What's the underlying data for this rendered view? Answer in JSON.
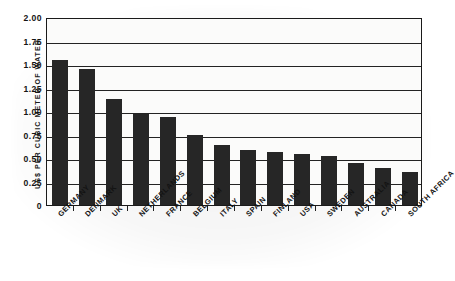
{
  "chart_data": {
    "type": "bar",
    "title": "",
    "subtitle": "",
    "xlabel": "",
    "ylabel": "US$ PER CUBIC METER OF WATER",
    "ylim": [
      0,
      2.0
    ],
    "ytick_labels": [
      "2.00",
      "1.75",
      "1.50",
      "1.25",
      "1.00",
      "0.75",
      "0.50",
      "0.25",
      "0"
    ],
    "ytick_values": [
      2.0,
      1.75,
      1.5,
      1.25,
      1.0,
      0.75,
      0.5,
      0.25,
      0
    ],
    "grid": "horizontal",
    "legend": "none",
    "bar_color": "#262626",
    "categories": [
      "GERMANY",
      "DENMARK",
      "UK",
      "NETHERLANDS",
      "FRANCE",
      "BELGIUM",
      "ITALY",
      "SPAIN",
      "FINLAND",
      "USA",
      "SWEDEN",
      "AUSTRALIA",
      "CANADA",
      "SOUTH AFRICA"
    ],
    "values": [
      1.54,
      1.45,
      1.13,
      0.97,
      0.94,
      0.75,
      0.64,
      0.59,
      0.56,
      0.54,
      0.52,
      0.45,
      0.39,
      0.35
    ]
  }
}
